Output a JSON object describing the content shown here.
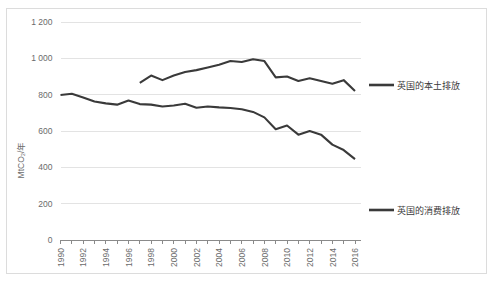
{
  "chart_data": {
    "type": "line",
    "title": "",
    "subtitle": "",
    "xlabel": "",
    "ylabel": "MtCO₂/年",
    "xlim": [
      1990,
      2016
    ],
    "ylim": [
      0,
      1200
    ],
    "grid": true,
    "legend_position": "right",
    "y_ticks": [
      0,
      200,
      400,
      600,
      800,
      1000,
      1200
    ],
    "y_tick_labels": [
      "0",
      "200",
      "400",
      "600",
      "800",
      "1 000",
      "1 200"
    ],
    "x_ticks": [
      1990,
      1991,
      1992,
      1993,
      1994,
      1995,
      1996,
      1997,
      1998,
      1999,
      2000,
      2001,
      2002,
      2003,
      2004,
      2005,
      2006,
      2007,
      2008,
      2009,
      2010,
      2011,
      2012,
      2013,
      2014,
      2015,
      2016
    ],
    "x_tick_labels": [
      "1990",
      "",
      "1992",
      "",
      "1994",
      "",
      "1996",
      "",
      "1998",
      "",
      "2000",
      "",
      "2002",
      "",
      "2004",
      "",
      "2006",
      "",
      "2008",
      "",
      "2010",
      "",
      "2012",
      "",
      "2014",
      "",
      "2016"
    ],
    "series": [
      {
        "name": "英国的本土排放",
        "color": "#3a3a3a",
        "x": [
          1997,
          1998,
          1999,
          2000,
          2001,
          2002,
          2003,
          2004,
          2005,
          2006,
          2007,
          2008,
          2009,
          2010,
          2011,
          2012,
          2013,
          2014,
          2015,
          2016
        ],
        "values": [
          865,
          905,
          880,
          905,
          925,
          935,
          950,
          965,
          985,
          980,
          995,
          985,
          895,
          900,
          875,
          890,
          875,
          860,
          880,
          820
        ]
      },
      {
        "name": "英国的消费排放",
        "color": "#3a3a3a",
        "x": [
          1990,
          1991,
          1992,
          1993,
          1994,
          1995,
          1996,
          1997,
          1998,
          1999,
          2000,
          2001,
          2002,
          2003,
          2004,
          2005,
          2006,
          2007,
          2008,
          2009,
          2010,
          2011,
          2012,
          2013,
          2014,
          2015,
          2016
        ],
        "values": [
          798,
          805,
          785,
          762,
          752,
          745,
          768,
          748,
          745,
          735,
          740,
          750,
          728,
          735,
          730,
          727,
          720,
          705,
          675,
          610,
          630,
          580,
          600,
          580,
          525,
          495,
          445
        ]
      }
    ],
    "legend_entries": [
      {
        "label": "英国的本土排放",
        "color": "#3a3a3a"
      },
      {
        "label": "英国的消费排放",
        "color": "#3a3a3a"
      }
    ],
    "colors": {
      "line": "#3a3a3a",
      "grid": "#e3e3e3",
      "axis": "#8a8a8a",
      "tick_text": "#6b6b6b",
      "legend_text": "#3b3b3b",
      "frame_border": "#dcdcdc",
      "background": "#ffffff"
    }
  }
}
